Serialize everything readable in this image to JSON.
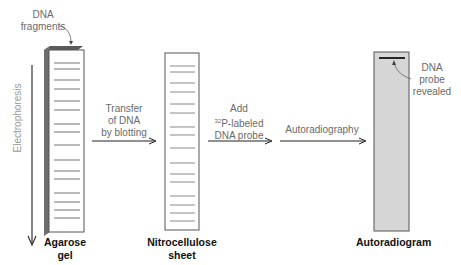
{
  "colors": {
    "band": "#8a8a8a",
    "gel_side": "#6e6e6e",
    "gel_top": "#5a5a5a",
    "outline": "#555555",
    "autoradiogram_fill": "#d6d6d6",
    "probe_band": "#111111",
    "arrow": "#222222",
    "label_text": "#6a6a6a",
    "caption_text": "#111111"
  },
  "labels": {
    "dna_fragments_line1": "DNA",
    "dna_fragments_line2": "fragments",
    "electrophoresis": "Electrophoresis",
    "transfer_line1": "Transfer",
    "transfer_line2": "of DNA",
    "transfer_line3": "by blotting",
    "add_line1": "Add",
    "add_sup": "32",
    "add_line2_rest": "P-labeled",
    "add_line3": "DNA probe",
    "autoradiography": "Autoradiography",
    "probe_line1": "DNA",
    "probe_line2": "probe",
    "probe_line3": "revealed"
  },
  "captions": {
    "agarose_line1": "Agarose",
    "agarose_line2": "gel",
    "nitro_line1": "Nitrocellulose",
    "nitro_line2": "sheet",
    "autoradiogram": "Autoradiogram"
  },
  "gel_bands_y": [
    63,
    69,
    80,
    89,
    101,
    110,
    124,
    132,
    145,
    160,
    171,
    179,
    193,
    202,
    210,
    218
  ],
  "probe_band_y": 58
}
